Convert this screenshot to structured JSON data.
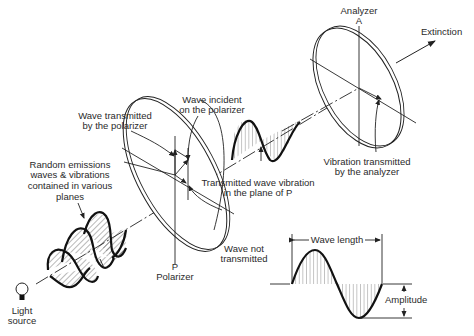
{
  "diagram": {
    "labels": {
      "analyzer": "Analyzer",
      "analyzer_letter": "A",
      "extinction": "Extinction",
      "wave_incident_1": "Wave incident",
      "wave_incident_2": "on the polarizer",
      "wave_transmitted_1": "Wave transmitted",
      "wave_transmitted_2": "by the polarizer",
      "random_1": "Random emissions",
      "random_2": "waves & vibrations",
      "random_3": "contained in various",
      "random_4": "planes",
      "vibration_analyzer_1": "Vibration transmitted",
      "vibration_analyzer_2": "by the analyzer",
      "transmitted_plane_1": "Transmitted wave vibration",
      "transmitted_plane_2": "in the plane of P",
      "wave_not_1": "Wave not",
      "wave_not_2": "transmitted",
      "polarizer_letter": "P",
      "polarizer": "Polarizer",
      "light_1": "Light",
      "light_2": "source",
      "wave_length": "Wave length",
      "amplitude": "Amplitude"
    },
    "colors": {
      "line": "#222222",
      "background": "#ffffff"
    },
    "components": [
      "light-source",
      "random-waves",
      "polarizer-disc",
      "polarized-wave",
      "analyzer-disc",
      "wavelength-inset"
    ]
  }
}
